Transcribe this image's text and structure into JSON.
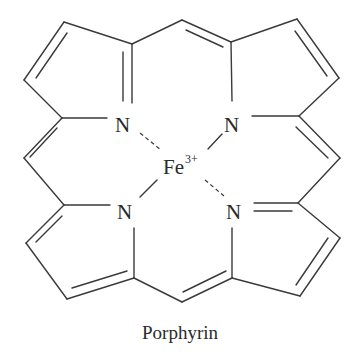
{
  "diagram": {
    "caption": "Porphyrin",
    "metal": {
      "symbol": "Fe",
      "charge": "3+"
    },
    "nitrogens": [
      {
        "label": "N",
        "position": "top-left",
        "bond_to_metal": "dashed"
      },
      {
        "label": "N",
        "position": "top-right",
        "bond_to_metal": "solid"
      },
      {
        "label": "N",
        "position": "bottom-left",
        "bond_to_metal": "solid"
      },
      {
        "label": "N",
        "position": "bottom-right",
        "bond_to_metal": "dashed"
      }
    ],
    "rings": 4,
    "ring_type": "pyrrole",
    "meso_bridges": 4,
    "line_color": "#3a3a3a",
    "background": "#ffffff"
  }
}
